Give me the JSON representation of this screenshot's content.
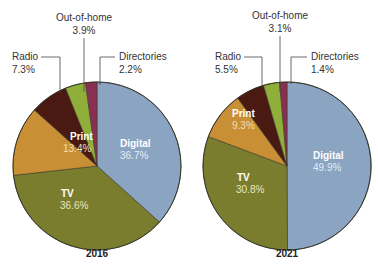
{
  "chart_data": [
    {
      "type": "pie",
      "title": "2016",
      "categories": [
        "Digital",
        "TV",
        "Print",
        "Radio",
        "Out-of-home",
        "Directories"
      ],
      "values": [
        36.7,
        36.6,
        13.4,
        7.3,
        3.9,
        2.2
      ],
      "labels": [
        "36.7%",
        "36.6%",
        "13.4%",
        "7.3%",
        "3.9%",
        "2.2%"
      ],
      "colors": [
        "#8aa4c2",
        "#7a7d2e",
        "#c98f34",
        "#4a1a12",
        "#8fae3a",
        "#8a2f52"
      ],
      "start": "top",
      "direction": "clockwise"
    },
    {
      "type": "pie",
      "title": "2021",
      "categories": [
        "Digital",
        "TV",
        "Print",
        "Radio",
        "Out-of-home",
        "Directories"
      ],
      "values": [
        49.9,
        30.8,
        9.3,
        5.5,
        3.1,
        1.4
      ],
      "labels": [
        "49.9%",
        "30.8%",
        "9.3%",
        "5.5%",
        "3.1%",
        "1.4%"
      ],
      "colors": [
        "#8aa4c2",
        "#7a7d2e",
        "#c98f34",
        "#4a1a12",
        "#8fae3a",
        "#8a2f52"
      ],
      "start": "top",
      "direction": "clockwise"
    }
  ],
  "pies": [
    {
      "year": "2016",
      "inside": {
        "digital": {
          "name": "Digital",
          "pct": "36.7%"
        },
        "tv": {
          "name": "TV",
          "pct": "36.6%"
        },
        "print": {
          "name": "Print",
          "pct": "13.4%"
        }
      },
      "callouts": {
        "radio": {
          "name": "Radio",
          "pct": "7.3%"
        },
        "ooh": {
          "name": "Out-of-home",
          "pct": "3.9%"
        },
        "directories": {
          "name": "Directories",
          "pct": "2.2%"
        }
      }
    },
    {
      "year": "2021",
      "inside": {
        "digital": {
          "name": "Digital",
          "pct": "49.9%"
        },
        "tv": {
          "name": "TV",
          "pct": "30.8%"
        },
        "print": {
          "name": "Print",
          "pct": "9.3%"
        }
      },
      "callouts": {
        "radio": {
          "name": "Radio",
          "pct": "5.5%"
        },
        "ooh": {
          "name": "Out-of-home",
          "pct": "3.1%"
        },
        "directories": {
          "name": "Directories",
          "pct": "1.4%"
        }
      }
    }
  ]
}
